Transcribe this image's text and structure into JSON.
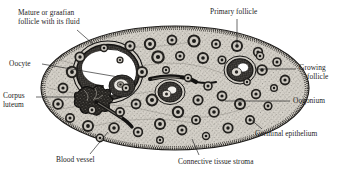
{
  "figure": {
    "kind": "histology-illustration",
    "background_color": "#ffffff",
    "ink_color": "#1d1d1d",
    "stroma_fill": "#d9d6cf",
    "antrum_fill": "#ffffff"
  },
  "labels": [
    {
      "id": "mature-graafian-follicle",
      "line1": "Mature or graafian",
      "line2": "follicle with its fluid",
      "align": "left",
      "x": 18,
      "y": 9,
      "leader": {
        "x1": 77,
        "y1": 30,
        "x2": 93,
        "y2": 44
      }
    },
    {
      "id": "primary-follicle",
      "line1": "Primary follicle",
      "line2": "",
      "align": "left",
      "x": 210,
      "y": 8,
      "leader": {
        "x1": 237,
        "y1": 19,
        "x2": 237,
        "y2": 45
      }
    },
    {
      "id": "oocyte",
      "line1": "Oocyte",
      "line2": "",
      "align": "left",
      "x": 9,
      "y": 60,
      "leader": {
        "x1": 42,
        "y1": 64,
        "x2": 130,
        "y2": 79
      }
    },
    {
      "id": "growing-follicle",
      "line1": "Growing",
      "line2": "follicle",
      "align": "left",
      "x": 299,
      "y": 64,
      "leader": {
        "x1": 296,
        "y1": 69,
        "x2": 258,
        "y2": 69
      }
    },
    {
      "id": "corpus-luteum",
      "line1": "Corpus",
      "line2": "luteum",
      "align": "left",
      "x": 3,
      "y": 92,
      "leader": {
        "x1": 36,
        "y1": 97,
        "x2": 76,
        "y2": 97
      }
    },
    {
      "id": "oogonium",
      "line1": "Oogonium",
      "line2": "",
      "align": "left",
      "x": 293,
      "y": 97,
      "leader": {
        "x1": 290,
        "y1": 101,
        "x2": 225,
        "y2": 101
      }
    },
    {
      "id": "germinal-epithelium",
      "line1": "Germinal epithelium",
      "line2": "",
      "align": "left",
      "x": 255,
      "y": 130,
      "leader": {
        "x1": 262,
        "y1": 129,
        "x2": 250,
        "y2": 119
      }
    },
    {
      "id": "connective-tissue-stroma",
      "line1": "Connective tissue stroma",
      "line2": "",
      "align": "left",
      "x": 178,
      "y": 158,
      "leader": {
        "x1": 199,
        "y1": 156,
        "x2": 193,
        "y2": 140
      }
    },
    {
      "id": "blood-vessel",
      "line1": "Blood vessel",
      "line2": "",
      "align": "left",
      "x": 56,
      "y": 156,
      "leader": {
        "x1": 90,
        "y1": 155,
        "x2": 107,
        "y2": 133
      }
    }
  ],
  "structures": {
    "ovary_outline": "large ellipse occupying center of frame",
    "graafian_follicle": "large follicle upper-left with white antrum and oocyte",
    "corpus_luteum": "dark irregular mass left-of-center",
    "blood_vessel": "elongated dark streak lower-center-left",
    "follicle_count_approx": 58
  }
}
